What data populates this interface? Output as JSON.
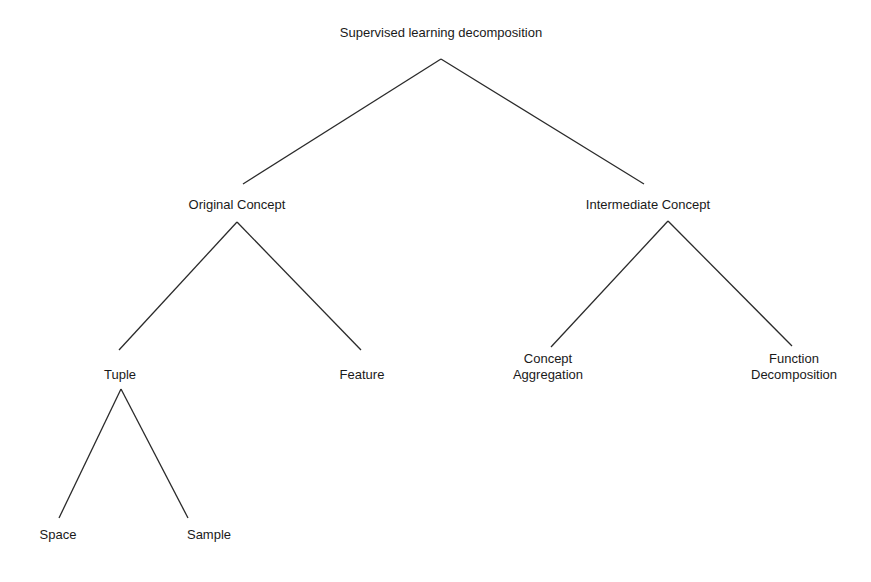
{
  "diagram": {
    "type": "tree",
    "title": "Supervised learning decomposition",
    "line_color": "#2a2a2a",
    "nodes": {
      "root": {
        "lines": [
          "Supervised learning decomposition"
        ]
      },
      "original": {
        "lines": [
          "Original Concept"
        ]
      },
      "intermediate": {
        "lines": [
          "Intermediate Concept"
        ]
      },
      "tuple": {
        "lines": [
          "Tuple"
        ]
      },
      "feature": {
        "lines": [
          "Feature"
        ]
      },
      "aggregation": {
        "lines": [
          "Concept",
          "Aggregation"
        ]
      },
      "function": {
        "lines": [
          "Function",
          "Decomposition"
        ]
      },
      "space": {
        "lines": [
          "Space"
        ]
      },
      "sample": {
        "lines": [
          "Sample"
        ]
      }
    },
    "edges": [
      {
        "from": "root",
        "to": "original"
      },
      {
        "from": "root",
        "to": "intermediate"
      },
      {
        "from": "original",
        "to": "tuple"
      },
      {
        "from": "original",
        "to": "feature"
      },
      {
        "from": "intermediate",
        "to": "aggregation"
      },
      {
        "from": "intermediate",
        "to": "function"
      },
      {
        "from": "tuple",
        "to": "space"
      },
      {
        "from": "tuple",
        "to": "sample"
      }
    ]
  }
}
